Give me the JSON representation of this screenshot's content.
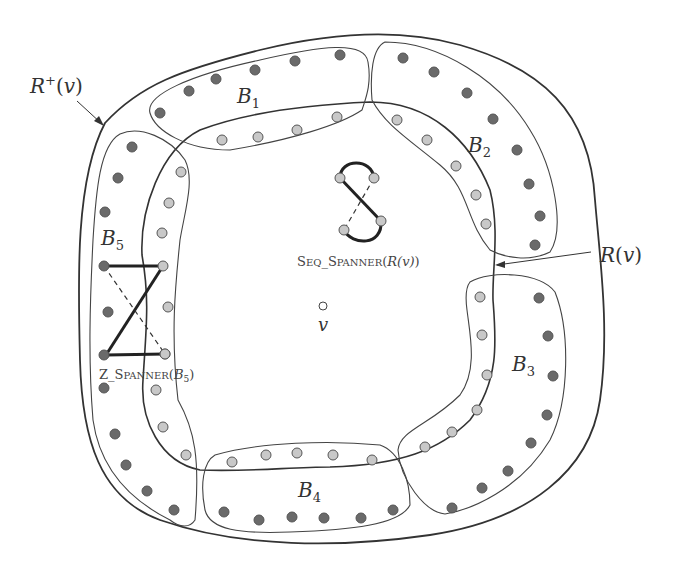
{
  "figure": {
    "labels": {
      "r_plus": {
        "main": "R",
        "sup": "+",
        "arg": "(v)",
        "x": 30,
        "y": 93
      },
      "r": {
        "main": "R",
        "arg": "(v)",
        "x": 600,
        "y": 262
      },
      "v": {
        "text": "v",
        "x": 318,
        "y": 331
      },
      "b1": {
        "main": "B",
        "sub": "1",
        "x": 237,
        "y": 103
      },
      "b2": {
        "main": "B",
        "sub": "2",
        "x": 468,
        "y": 152
      },
      "b3": {
        "main": "B",
        "sub": "3",
        "x": 512,
        "y": 371
      },
      "b4": {
        "main": "B",
        "sub": "4",
        "x": 298,
        "y": 497
      },
      "b5": {
        "main": "B",
        "sub": "5",
        "x": 101,
        "y": 245
      },
      "seq_spanner": {
        "prefix": "S",
        "small1": "EQ",
        "sep": "_",
        "prefix2": "S",
        "small2": "PANNER",
        "arg_open": "(",
        "arg": "R(v)",
        "arg_close": ")",
        "x": 297,
        "y": 266
      },
      "z_spanner": {
        "prefix": "Z",
        "sep": "_",
        "prefix2": "S",
        "small2": "PANNER",
        "arg_open": "(",
        "arg": "B",
        "arg_sub": "5",
        "arg_close": ")",
        "x": 99,
        "y": 379
      }
    },
    "colors": {
      "dark_dot": "#6a6a6a",
      "light_dot": "#c8c8c8",
      "dot_stroke": "#555555",
      "outline": "#333333",
      "spanner_edge": "#222222"
    },
    "clusters": [
      {
        "name": "B1",
        "outer_dots": [
          [
            160,
            113
          ],
          [
            189,
            91
          ],
          [
            216,
            79
          ],
          [
            255,
            70
          ],
          [
            295,
            61
          ],
          [
            340,
            55
          ]
        ],
        "inner_dots": [
          [
            222,
            140
          ],
          [
            258,
            137
          ],
          [
            297,
            130
          ],
          [
            337,
            117
          ]
        ]
      },
      {
        "name": "B2",
        "outer_dots": [
          [
            403,
            58
          ],
          [
            434,
            72
          ],
          [
            467,
            93
          ],
          [
            493,
            119
          ],
          [
            517,
            150
          ],
          [
            529,
            184
          ],
          [
            540,
            216
          ],
          [
            535,
            245
          ]
        ],
        "inner_dots": [
          [
            397,
            120
          ],
          [
            427,
            140
          ],
          [
            456,
            166
          ],
          [
            476,
            195
          ],
          [
            486,
            224
          ]
        ]
      },
      {
        "name": "B3",
        "outer_dots": [
          [
            539,
            298
          ],
          [
            548,
            336
          ],
          [
            553,
            376
          ],
          [
            547,
            415
          ],
          [
            531,
            443
          ],
          [
            508,
            471
          ],
          [
            482,
            488
          ],
          [
            452,
            508
          ]
        ],
        "inner_dots": [
          [
            480,
            297
          ],
          [
            482,
            335
          ],
          [
            487,
            375
          ],
          [
            477,
            410
          ],
          [
            452,
            432
          ],
          [
            425,
            447
          ]
        ]
      },
      {
        "name": "B4",
        "outer_dots": [
          [
            224,
            512
          ],
          [
            259,
            520
          ],
          [
            292,
            517
          ],
          [
            324,
            518
          ],
          [
            361,
            518
          ],
          [
            393,
            510
          ]
        ],
        "inner_dots": [
          [
            232,
            462
          ],
          [
            266,
            455
          ],
          [
            297,
            453
          ],
          [
            333,
            455
          ],
          [
            372,
            460
          ]
        ]
      },
      {
        "name": "B5",
        "outer_dots": [
          [
            132,
            147
          ],
          [
            118,
            178
          ],
          [
            105,
            212
          ],
          [
            104,
            266
          ],
          [
            108,
            312
          ],
          [
            104,
            388
          ],
          [
            115,
            434
          ],
          [
            126,
            465
          ],
          [
            147,
            491
          ],
          [
            174,
            510
          ]
        ],
        "inner_dots": [
          [
            181,
            172
          ],
          [
            169,
            203
          ],
          [
            162,
            233
          ],
          [
            163,
            266
          ],
          [
            168,
            307
          ],
          [
            165,
            354
          ],
          [
            156,
            390
          ],
          [
            163,
            427
          ],
          [
            186,
            455
          ]
        ]
      }
    ],
    "seq_spanner_dots": [
      [
        340,
        178
      ],
      [
        374,
        178
      ],
      [
        381,
        221
      ],
      [
        344,
        230
      ]
    ],
    "z_spanner_dots": [
      [
        104,
        266
      ],
      [
        163,
        266
      ],
      [
        104,
        355
      ],
      [
        165,
        354
      ]
    ],
    "center_vertex": [
      323,
      306
    ]
  }
}
